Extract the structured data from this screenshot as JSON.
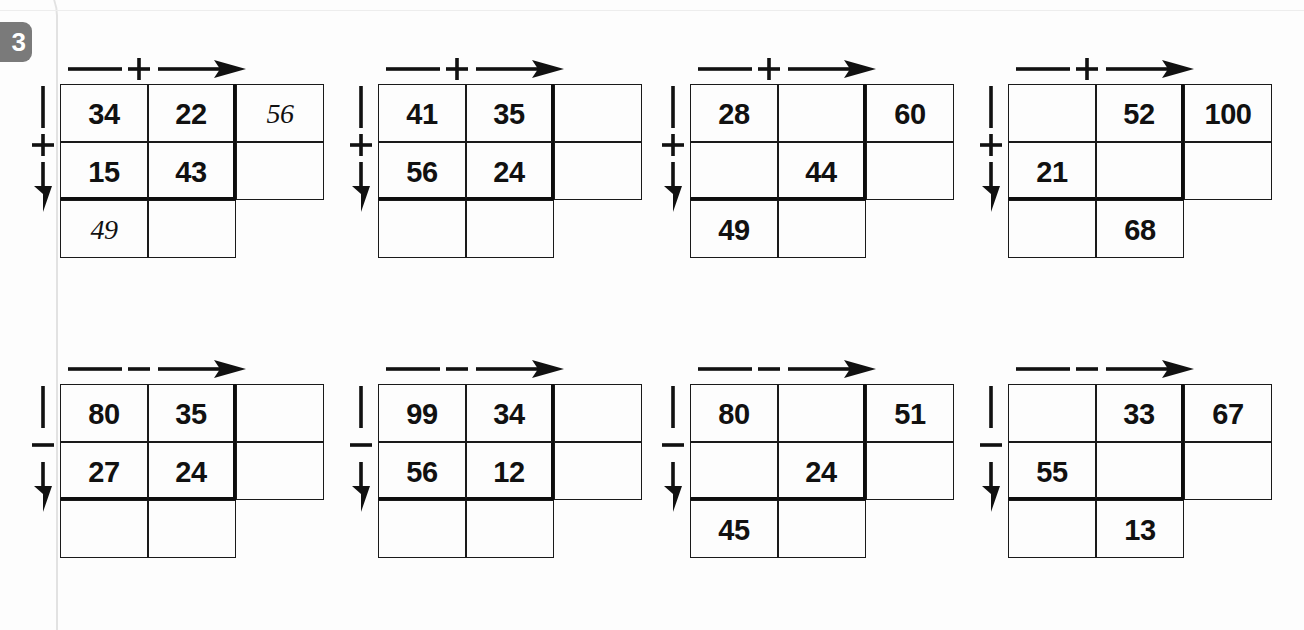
{
  "exercise": {
    "number": "3"
  },
  "legend": {
    "plus_symbol": "+",
    "minus_symbol": "−",
    "row_arrow_name": "horizontal-operator-arrow",
    "col_arrow_name": "vertical-operator-arrow"
  },
  "problems": [
    {
      "id": "problem-1",
      "row_operator": "+",
      "col_operator": "+",
      "cells": [
        [
          {
            "value": "34",
            "written": false
          },
          {
            "value": "22",
            "written": false
          },
          {
            "value": "56",
            "written": true
          }
        ],
        [
          {
            "value": "15",
            "written": false
          },
          {
            "value": "43",
            "written": false
          },
          {
            "value": "",
            "written": false
          }
        ],
        [
          {
            "value": "49",
            "written": true
          },
          {
            "value": "",
            "written": false
          }
        ]
      ]
    },
    {
      "id": "problem-2",
      "row_operator": "+",
      "col_operator": "+",
      "cells": [
        [
          {
            "value": "41",
            "written": false
          },
          {
            "value": "35",
            "written": false
          },
          {
            "value": "",
            "written": false
          }
        ],
        [
          {
            "value": "56",
            "written": false
          },
          {
            "value": "24",
            "written": false
          },
          {
            "value": "",
            "written": false
          }
        ],
        [
          {
            "value": "",
            "written": false
          },
          {
            "value": "",
            "written": false
          }
        ]
      ]
    },
    {
      "id": "problem-3",
      "row_operator": "+",
      "col_operator": "+",
      "cells": [
        [
          {
            "value": "28",
            "written": false
          },
          {
            "value": "",
            "written": false
          },
          {
            "value": "60",
            "written": false
          }
        ],
        [
          {
            "value": "",
            "written": false
          },
          {
            "value": "44",
            "written": false
          },
          {
            "value": "",
            "written": false
          }
        ],
        [
          {
            "value": "49",
            "written": false
          },
          {
            "value": "",
            "written": false
          }
        ]
      ]
    },
    {
      "id": "problem-4",
      "row_operator": "+",
      "col_operator": "+",
      "cells": [
        [
          {
            "value": "",
            "written": false
          },
          {
            "value": "52",
            "written": false
          },
          {
            "value": "100",
            "written": false
          }
        ],
        [
          {
            "value": "21",
            "written": false
          },
          {
            "value": "",
            "written": false
          },
          {
            "value": "",
            "written": false
          }
        ],
        [
          {
            "value": "",
            "written": false
          },
          {
            "value": "68",
            "written": false
          }
        ]
      ]
    },
    {
      "id": "problem-5",
      "row_operator": "−",
      "col_operator": "−",
      "cells": [
        [
          {
            "value": "80",
            "written": false
          },
          {
            "value": "35",
            "written": false
          },
          {
            "value": "",
            "written": false
          }
        ],
        [
          {
            "value": "27",
            "written": false
          },
          {
            "value": "24",
            "written": false
          },
          {
            "value": "",
            "written": false
          }
        ],
        [
          {
            "value": "",
            "written": false
          },
          {
            "value": "",
            "written": false
          }
        ]
      ]
    },
    {
      "id": "problem-6",
      "row_operator": "−",
      "col_operator": "−",
      "cells": [
        [
          {
            "value": "99",
            "written": false
          },
          {
            "value": "34",
            "written": false
          },
          {
            "value": "",
            "written": false
          }
        ],
        [
          {
            "value": "56",
            "written": false
          },
          {
            "value": "12",
            "written": false
          },
          {
            "value": "",
            "written": false
          }
        ],
        [
          {
            "value": "",
            "written": false
          },
          {
            "value": "",
            "written": false
          }
        ]
      ]
    },
    {
      "id": "problem-7",
      "row_operator": "−",
      "col_operator": "−",
      "cells": [
        [
          {
            "value": "80",
            "written": false
          },
          {
            "value": "",
            "written": false
          },
          {
            "value": "51",
            "written": false
          }
        ],
        [
          {
            "value": "",
            "written": false
          },
          {
            "value": "24",
            "written": false
          },
          {
            "value": "",
            "written": false
          }
        ],
        [
          {
            "value": "45",
            "written": false
          },
          {
            "value": "",
            "written": false
          }
        ]
      ]
    },
    {
      "id": "problem-8",
      "row_operator": "−",
      "col_operator": "−",
      "cells": [
        [
          {
            "value": "",
            "written": false
          },
          {
            "value": "33",
            "written": false
          },
          {
            "value": "67",
            "written": false
          }
        ],
        [
          {
            "value": "55",
            "written": false
          },
          {
            "value": "",
            "written": false
          },
          {
            "value": "",
            "written": false
          }
        ],
        [
          {
            "value": "",
            "written": false
          },
          {
            "value": "13",
            "written": false
          }
        ]
      ]
    }
  ],
  "layout": {
    "positions": [
      {
        "left": 60,
        "top": 56
      },
      {
        "left": 378,
        "top": 56
      },
      {
        "left": 690,
        "top": 56
      },
      {
        "left": 1008,
        "top": 56
      },
      {
        "left": 60,
        "top": 356
      },
      {
        "left": 378,
        "top": 356
      },
      {
        "left": 690,
        "top": 356
      },
      {
        "left": 1008,
        "top": 356
      }
    ],
    "col_widths": [
      88,
      88,
      88
    ],
    "row_heights": [
      58,
      58,
      58
    ]
  },
  "colors": {
    "ink": "#111111",
    "rule": "#1a1a1a",
    "heavy_rule": "#0d0d0d",
    "badge_bg": "#7a7a7a",
    "badge_fg": "#ffffff",
    "page_bg": "#fdfdfd"
  }
}
